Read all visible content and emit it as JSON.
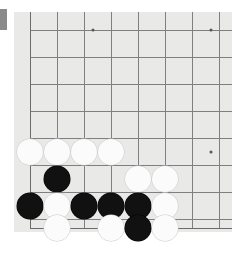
{
  "canvas": {
    "width": 243,
    "height": 257,
    "background": "#ffffff"
  },
  "margin_tab": {
    "label": "page-margin-marker",
    "color": "#8a8a8a",
    "x": 0,
    "y": 9,
    "width": 7,
    "height": 21
  },
  "board": {
    "label": "go-board",
    "background": "#e9e9e7",
    "line_color": "#7d7f80",
    "edge_color": "#6a6c6d",
    "x": 14,
    "y": 12,
    "width": 218,
    "height": 220,
    "cell_size": 27,
    "origin_x": 30,
    "origin_y": 30,
    "columns": [
      30,
      57,
      84,
      111,
      138,
      165,
      192,
      219
    ],
    "rows": [
      30,
      57,
      84,
      111,
      138,
      165,
      192,
      219
    ],
    "left_edge_x": 30,
    "bottom_edge_y": 228,
    "star_points": [
      {
        "name": "hoshi-upper-left",
        "x": 93,
        "y": 30
      },
      {
        "name": "hoshi-upper-right",
        "x": 211,
        "y": 30
      },
      {
        "name": "hoshi-lower-right",
        "x": 211,
        "y": 152
      }
    ]
  },
  "stones": {
    "radius": 13,
    "black_color": "#111111",
    "white_color": "#fbfbfb",
    "items": [
      {
        "color": "white",
        "x": 30,
        "y": 152
      },
      {
        "color": "white",
        "x": 57,
        "y": 152
      },
      {
        "color": "white",
        "x": 84,
        "y": 152
      },
      {
        "color": "white",
        "x": 111,
        "y": 152
      },
      {
        "color": "black",
        "x": 57,
        "y": 179
      },
      {
        "color": "white",
        "x": 138,
        "y": 179
      },
      {
        "color": "white",
        "x": 165,
        "y": 179
      },
      {
        "color": "black",
        "x": 30,
        "y": 206
      },
      {
        "color": "white",
        "x": 57,
        "y": 206
      },
      {
        "color": "black",
        "x": 84,
        "y": 206
      },
      {
        "color": "black",
        "x": 111,
        "y": 206
      },
      {
        "color": "black",
        "x": 138,
        "y": 206
      },
      {
        "color": "white",
        "x": 165,
        "y": 206
      },
      {
        "color": "white",
        "x": 57,
        "y": 228
      },
      {
        "color": "white",
        "x": 111,
        "y": 228
      },
      {
        "color": "black",
        "x": 138,
        "y": 228
      },
      {
        "color": "white",
        "x": 165,
        "y": 228
      }
    ]
  }
}
